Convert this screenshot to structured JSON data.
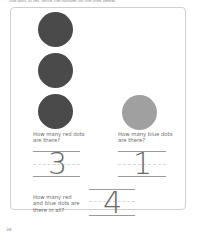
{
  "instruction": "Use dots to tell. Write the number on the lines below.",
  "dots": {
    "red_count": 3,
    "blue_count": 1,
    "red_color": "#4a4a4a",
    "blue_color": "#a0a0a0"
  },
  "questions": [
    {
      "text_line1": "How many red dots",
      "text_line2": "are there?",
      "answer": "3"
    },
    {
      "text_line1": "How many blue dots",
      "text_line2": "are there?",
      "answer": "1"
    },
    {
      "text_line1": "How many red",
      "text_line2": "and blue dots are",
      "text_line3": "there in all?",
      "answer": "4"
    }
  ],
  "page_number": "34"
}
